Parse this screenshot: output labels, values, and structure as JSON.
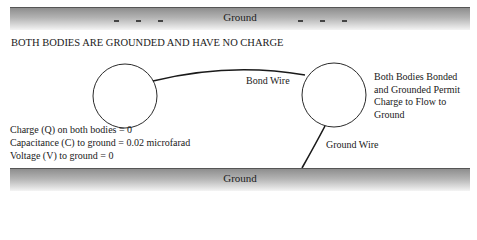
{
  "top_ground": {
    "label": "Ground",
    "left_charges": [
      "-",
      "-",
      "-"
    ],
    "right_charges": [
      "-",
      "-",
      "-"
    ]
  },
  "title": "BOTH BODIES ARE GROUNDED AND HAVE NO CHARGE",
  "bond_wire_label": "Bond Wire",
  "ground_wire_label": "Ground Wire",
  "right_note": [
    "Both Bodies Bonded",
    "and Grounded Permit",
    "Charge to Flow to",
    "Ground"
  ],
  "facts": [
    "Charge (Q) on both bodies = 0",
    "Capacitance (C) to ground = 0.02 microfarad",
    "Voltage (V) to ground = 0"
  ],
  "bottom_ground": {
    "label": "Ground"
  },
  "colors": {
    "bar_dark": "#8e8e8e",
    "bar_light": "#f4f4f4",
    "line": "#1a1a1a"
  }
}
